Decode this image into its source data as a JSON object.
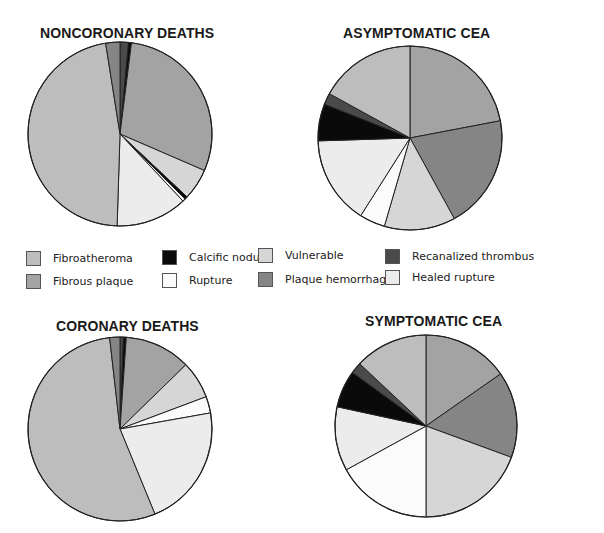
{
  "colors": {
    "Fibroatheroma": "#bdbdbd",
    "Fibrous plaque": "#a3a3a3",
    "Calcific nodule": "#0a0a0a",
    "Rupture": "#fbfbfb",
    "Vulnerable": "#d6d6d6",
    "Plaque hemorrhage": "#858585",
    "Recanalized thrombus": "#4a4a4a",
    "Healed rupture": "#ececec"
  },
  "legend": {
    "items": [
      {
        "label": "Fibroatheroma",
        "x": 26,
        "y": 6
      },
      {
        "label": "Fibrous plaque",
        "x": 26,
        "y": 29
      },
      {
        "label": "Calcific nodule",
        "x": 162,
        "y": 5
      },
      {
        "label": "Rupture",
        "x": 162,
        "y": 28
      },
      {
        "label": "Vulnerable",
        "x": 258,
        "y": 3
      },
      {
        "label": "Plaque hemorrhage",
        "x": 258,
        "y": 27
      },
      {
        "label": "Recanalized thrombus",
        "x": 385,
        "y": 4
      },
      {
        "label": "Healed rupture",
        "x": 385,
        "y": 25
      }
    ]
  },
  "chart_data": [
    {
      "type": "pie",
      "title": "NONCORONARY DEATHS",
      "start_angle": 0,
      "direction": "clockwise",
      "slices": [
        {
          "label": "Recanalized thrombus",
          "value": 1.5
        },
        {
          "label": "Calcific nodule",
          "value": 0.5
        },
        {
          "label": "Fibrous plaque",
          "value": 29.5
        },
        {
          "label": "Vulnerable",
          "value": 5.5
        },
        {
          "label": "Calcific nodule",
          "value": 0.5
        },
        {
          "label": "Rupture",
          "value": 0.5
        },
        {
          "label": "Healed rupture",
          "value": 12.5
        },
        {
          "label": "Fibroatheroma",
          "value": 47.0
        },
        {
          "label": "Plaque hemorrhage",
          "value": 2.5
        }
      ]
    },
    {
      "type": "pie",
      "title": "ASYMPTOMATIC CEA",
      "start_angle": 0,
      "direction": "clockwise",
      "slices": [
        {
          "label": "Fibrous plaque",
          "value": 22.0
        },
        {
          "label": "Plaque hemorrhage",
          "value": 20.0
        },
        {
          "label": "Vulnerable",
          "value": 12.5
        },
        {
          "label": "Rupture",
          "value": 4.5
        },
        {
          "label": "Healed rupture",
          "value": 15.5
        },
        {
          "label": "Calcific nodule",
          "value": 6.5
        },
        {
          "label": "Recanalized thrombus",
          "value": 2.0
        },
        {
          "label": "Fibroatheroma",
          "value": 17.0
        }
      ]
    },
    {
      "type": "pie",
      "title": "CORONARY DEATHS",
      "start_angle": 0,
      "direction": "clockwise",
      "slices": [
        {
          "label": "Recanalized thrombus",
          "value": 0.6
        },
        {
          "label": "Calcific nodule",
          "value": 0.5
        },
        {
          "label": "Fibrous plaque",
          "value": 11.6
        },
        {
          "label": "Vulnerable",
          "value": 6.6
        },
        {
          "label": "Rupture",
          "value": 2.9
        },
        {
          "label": "Healed rupture",
          "value": 21.6
        },
        {
          "label": "Fibroatheroma",
          "value": 54.4
        },
        {
          "label": "Plaque hemorrhage",
          "value": 1.8
        }
      ]
    },
    {
      "type": "pie",
      "title": "SYMPTOMATIC CEA",
      "start_angle": 0,
      "direction": "clockwise",
      "slices": [
        {
          "label": "Fibrous plaque",
          "value": 15.3
        },
        {
          "label": "Plaque hemorrhage",
          "value": 15.3
        },
        {
          "label": "Vulnerable",
          "value": 19.4
        },
        {
          "label": "Rupture",
          "value": 17.0
        },
        {
          "label": "Healed rupture",
          "value": 11.4
        },
        {
          "label": "Calcific nodule",
          "value": 6.6
        },
        {
          "label": "Recanalized thrombus",
          "value": 2.0
        },
        {
          "label": "Fibroatheroma",
          "value": 13.0
        }
      ]
    }
  ],
  "layout": [
    {
      "title_x": 40,
      "title_y": 25,
      "cx": 120,
      "cy": 134,
      "r": 92
    },
    {
      "title_x": 343,
      "title_y": 25,
      "cx": 410,
      "cy": 138,
      "r": 92
    },
    {
      "title_x": 56,
      "title_y": 318,
      "cx": 120,
      "cy": 429,
      "r": 92
    },
    {
      "title_x": 365,
      "title_y": 313,
      "cx": 426,
      "cy": 426,
      "r": 91
    }
  ]
}
